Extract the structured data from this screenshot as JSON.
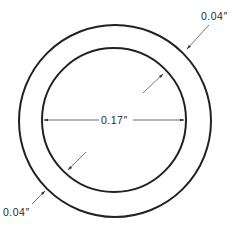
{
  "diagram": {
    "type": "annular-ring-cross-section",
    "outer_circle": {
      "cx": 115,
      "cy": 121,
      "r": 96
    },
    "inner_circle": {
      "cx": 114,
      "cy": 120,
      "r": 72
    },
    "stroke_color": "#222222",
    "dimensions": {
      "inner_diameter": {
        "label": "0.17″",
        "value": 0.17,
        "unit": "in"
      },
      "wall_thickness_top_right": {
        "label": "0.04″",
        "value": 0.04,
        "unit": "in"
      },
      "wall_thickness_bottom_left": {
        "label": "0.04″",
        "value": 0.04,
        "unit": "in"
      }
    }
  }
}
